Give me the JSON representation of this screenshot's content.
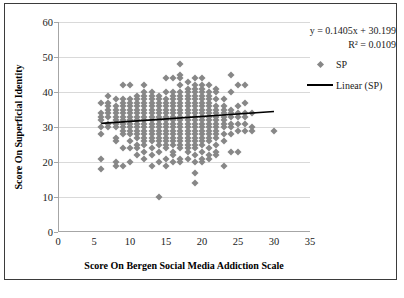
{
  "chart_data": {
    "type": "scatter",
    "title": "",
    "xlabel": "Score On Bergen Social Media Addiction Scale",
    "ylabel": "Score On Superficial Identity",
    "xlim": [
      0,
      35
    ],
    "ylim": [
      0,
      60
    ],
    "xticks": [
      0,
      5,
      10,
      15,
      20,
      25,
      30,
      35
    ],
    "yticks": [
      0,
      10,
      20,
      30,
      40,
      50,
      60
    ],
    "grid": "horizontal",
    "legend_position": "right",
    "marker_color": "#878787",
    "marker_shape": "diamond",
    "trendline_color": "#000000",
    "annotations": {
      "equation": "y = 0.1405x + 30.199",
      "r_squared": "R² = 0.0109"
    },
    "legend": [
      {
        "label": "SP",
        "key": "diamond"
      },
      {
        "label": "Linear (SP)",
        "key": "line"
      }
    ],
    "trendline": {
      "slope": 0.1405,
      "intercept": 30.199,
      "r2": 0.0109,
      "x_start": 6,
      "x_end": 30,
      "y_start": 31.04,
      "y_end": 34.41
    },
    "series": [
      {
        "name": "SP",
        "points": [
          [
            6,
            18
          ],
          [
            6,
            21
          ],
          [
            6,
            28
          ],
          [
            6,
            33
          ],
          [
            6,
            34
          ],
          [
            6,
            37
          ],
          [
            6,
            30
          ],
          [
            6,
            32
          ],
          [
            7,
            30
          ],
          [
            7,
            33
          ],
          [
            7,
            34
          ],
          [
            7,
            35
          ],
          [
            7,
            36
          ],
          [
            7,
            39
          ],
          [
            7,
            31
          ],
          [
            7,
            37
          ],
          [
            8,
            19
          ],
          [
            8,
            20
          ],
          [
            8,
            26
          ],
          [
            8,
            27
          ],
          [
            8,
            30
          ],
          [
            8,
            32
          ],
          [
            8,
            33
          ],
          [
            8,
            34
          ],
          [
            8,
            35
          ],
          [
            8,
            36
          ],
          [
            8,
            38
          ],
          [
            8,
            31
          ],
          [
            9,
            19
          ],
          [
            9,
            24
          ],
          [
            9,
            29
          ],
          [
            9,
            30
          ],
          [
            9,
            31
          ],
          [
            9,
            32
          ],
          [
            9,
            33
          ],
          [
            9,
            34
          ],
          [
            9,
            35
          ],
          [
            9,
            36
          ],
          [
            9,
            37
          ],
          [
            9,
            38
          ],
          [
            9,
            42
          ],
          [
            9,
            28
          ],
          [
            10,
            20
          ],
          [
            10,
            24
          ],
          [
            10,
            28
          ],
          [
            10,
            29
          ],
          [
            10,
            30
          ],
          [
            10,
            31
          ],
          [
            10,
            32
          ],
          [
            10,
            33
          ],
          [
            10,
            34
          ],
          [
            10,
            35
          ],
          [
            10,
            36
          ],
          [
            10,
            37
          ],
          [
            10,
            38
          ],
          [
            10,
            42
          ],
          [
            10,
            26
          ],
          [
            11,
            22
          ],
          [
            11,
            25
          ],
          [
            11,
            27
          ],
          [
            11,
            28
          ],
          [
            11,
            29
          ],
          [
            11,
            30
          ],
          [
            11,
            31
          ],
          [
            11,
            32
          ],
          [
            11,
            33
          ],
          [
            11,
            34
          ],
          [
            11,
            35
          ],
          [
            11,
            36
          ],
          [
            11,
            37
          ],
          [
            11,
            38
          ],
          [
            11,
            39
          ],
          [
            11,
            24
          ],
          [
            12,
            21
          ],
          [
            12,
            23
          ],
          [
            12,
            25
          ],
          [
            12,
            26
          ],
          [
            12,
            27
          ],
          [
            12,
            28
          ],
          [
            12,
            29
          ],
          [
            12,
            30
          ],
          [
            12,
            31
          ],
          [
            12,
            32
          ],
          [
            12,
            33
          ],
          [
            12,
            34
          ],
          [
            12,
            35
          ],
          [
            12,
            36
          ],
          [
            12,
            37
          ],
          [
            12,
            38
          ],
          [
            12,
            39
          ],
          [
            12,
            40
          ],
          [
            12,
            42
          ],
          [
            13,
            19
          ],
          [
            13,
            22
          ],
          [
            13,
            24
          ],
          [
            13,
            26
          ],
          [
            13,
            27
          ],
          [
            13,
            28
          ],
          [
            13,
            29
          ],
          [
            13,
            30
          ],
          [
            13,
            31
          ],
          [
            13,
            32
          ],
          [
            13,
            33
          ],
          [
            13,
            34
          ],
          [
            13,
            35
          ],
          [
            13,
            36
          ],
          [
            13,
            37
          ],
          [
            13,
            38
          ],
          [
            13,
            39
          ],
          [
            13,
            40
          ],
          [
            14,
            10
          ],
          [
            14,
            20
          ],
          [
            14,
            23
          ],
          [
            14,
            25
          ],
          [
            14,
            26
          ],
          [
            14,
            27
          ],
          [
            14,
            28
          ],
          [
            14,
            29
          ],
          [
            14,
            30
          ],
          [
            14,
            31
          ],
          [
            14,
            32
          ],
          [
            14,
            33
          ],
          [
            14,
            34
          ],
          [
            14,
            35
          ],
          [
            14,
            36
          ],
          [
            14,
            37
          ],
          [
            14,
            38
          ],
          [
            14,
            39
          ],
          [
            15,
            19
          ],
          [
            15,
            21
          ],
          [
            15,
            24
          ],
          [
            15,
            25
          ],
          [
            15,
            26
          ],
          [
            15,
            27
          ],
          [
            15,
            28
          ],
          [
            15,
            29
          ],
          [
            15,
            30
          ],
          [
            15,
            31
          ],
          [
            15,
            32
          ],
          [
            15,
            33
          ],
          [
            15,
            34
          ],
          [
            15,
            35
          ],
          [
            15,
            36
          ],
          [
            15,
            37
          ],
          [
            15,
            38
          ],
          [
            15,
            40
          ],
          [
            15,
            44
          ],
          [
            16,
            20
          ],
          [
            16,
            22
          ],
          [
            16,
            23
          ],
          [
            16,
            25
          ],
          [
            16,
            26
          ],
          [
            16,
            27
          ],
          [
            16,
            28
          ],
          [
            16,
            29
          ],
          [
            16,
            30
          ],
          [
            16,
            31
          ],
          [
            16,
            32
          ],
          [
            16,
            33
          ],
          [
            16,
            34
          ],
          [
            16,
            35
          ],
          [
            16,
            36
          ],
          [
            16,
            37
          ],
          [
            16,
            38
          ],
          [
            16,
            39
          ],
          [
            16,
            40
          ],
          [
            16,
            44
          ],
          [
            17,
            20
          ],
          [
            17,
            21
          ],
          [
            17,
            24
          ],
          [
            17,
            25
          ],
          [
            17,
            26
          ],
          [
            17,
            27
          ],
          [
            17,
            28
          ],
          [
            17,
            29
          ],
          [
            17,
            30
          ],
          [
            17,
            31
          ],
          [
            17,
            32
          ],
          [
            17,
            33
          ],
          [
            17,
            34
          ],
          [
            17,
            35
          ],
          [
            17,
            36
          ],
          [
            17,
            37
          ],
          [
            17,
            38
          ],
          [
            17,
            39
          ],
          [
            17,
            40
          ],
          [
            17,
            42
          ],
          [
            17,
            44
          ],
          [
            17,
            45
          ],
          [
            17,
            48
          ],
          [
            18,
            21
          ],
          [
            18,
            23
          ],
          [
            18,
            24
          ],
          [
            18,
            25
          ],
          [
            18,
            26
          ],
          [
            18,
            27
          ],
          [
            18,
            28
          ],
          [
            18,
            29
          ],
          [
            18,
            30
          ],
          [
            18,
            31
          ],
          [
            18,
            32
          ],
          [
            18,
            33
          ],
          [
            18,
            34
          ],
          [
            18,
            35
          ],
          [
            18,
            36
          ],
          [
            18,
            37
          ],
          [
            18,
            38
          ],
          [
            18,
            39
          ],
          [
            18,
            40
          ],
          [
            18,
            41
          ],
          [
            18,
            43
          ],
          [
            19,
            14
          ],
          [
            19,
            17
          ],
          [
            19,
            20
          ],
          [
            19,
            22
          ],
          [
            19,
            24
          ],
          [
            19,
            25
          ],
          [
            19,
            26
          ],
          [
            19,
            27
          ],
          [
            19,
            28
          ],
          [
            19,
            29
          ],
          [
            19,
            30
          ],
          [
            19,
            31
          ],
          [
            19,
            32
          ],
          [
            19,
            33
          ],
          [
            19,
            34
          ],
          [
            19,
            35
          ],
          [
            19,
            36
          ],
          [
            19,
            37
          ],
          [
            19,
            38
          ],
          [
            19,
            39
          ],
          [
            19,
            40
          ],
          [
            19,
            41
          ],
          [
            19,
            42
          ],
          [
            19,
            44
          ],
          [
            20,
            20
          ],
          [
            20,
            21
          ],
          [
            20,
            23
          ],
          [
            20,
            25
          ],
          [
            20,
            26
          ],
          [
            20,
            27
          ],
          [
            20,
            28
          ],
          [
            20,
            29
          ],
          [
            20,
            30
          ],
          [
            20,
            31
          ],
          [
            20,
            32
          ],
          [
            20,
            33
          ],
          [
            20,
            34
          ],
          [
            20,
            35
          ],
          [
            20,
            36
          ],
          [
            20,
            37
          ],
          [
            20,
            38
          ],
          [
            20,
            39
          ],
          [
            20,
            40
          ],
          [
            20,
            41
          ],
          [
            20,
            42
          ],
          [
            20,
            44
          ],
          [
            21,
            21
          ],
          [
            21,
            22
          ],
          [
            21,
            24
          ],
          [
            21,
            26
          ],
          [
            21,
            27
          ],
          [
            21,
            28
          ],
          [
            21,
            29
          ],
          [
            21,
            30
          ],
          [
            21,
            31
          ],
          [
            21,
            32
          ],
          [
            21,
            33
          ],
          [
            21,
            34
          ],
          [
            21,
            35
          ],
          [
            21,
            36
          ],
          [
            21,
            37
          ],
          [
            21,
            38
          ],
          [
            21,
            39
          ],
          [
            21,
            40
          ],
          [
            21,
            42
          ],
          [
            22,
            22
          ],
          [
            22,
            23
          ],
          [
            22,
            25
          ],
          [
            22,
            27
          ],
          [
            22,
            28
          ],
          [
            22,
            29
          ],
          [
            22,
            30
          ],
          [
            22,
            31
          ],
          [
            22,
            32
          ],
          [
            22,
            33
          ],
          [
            22,
            34
          ],
          [
            22,
            35
          ],
          [
            22,
            36
          ],
          [
            22,
            38
          ],
          [
            22,
            40
          ],
          [
            22,
            41
          ],
          [
            23,
            19
          ],
          [
            23,
            26
          ],
          [
            23,
            28
          ],
          [
            23,
            30
          ],
          [
            23,
            31
          ],
          [
            23,
            32
          ],
          [
            23,
            33
          ],
          [
            23,
            34
          ],
          [
            23,
            35
          ],
          [
            23,
            36
          ],
          [
            23,
            38
          ],
          [
            24,
            23
          ],
          [
            24,
            28
          ],
          [
            24,
            30
          ],
          [
            24,
            31
          ],
          [
            24,
            33
          ],
          [
            24,
            34
          ],
          [
            24,
            35
          ],
          [
            24,
            40
          ],
          [
            24,
            45
          ],
          [
            25,
            23
          ],
          [
            25,
            29
          ],
          [
            25,
            31
          ],
          [
            25,
            33
          ],
          [
            25,
            34
          ],
          [
            25,
            36
          ],
          [
            25,
            42
          ],
          [
            26,
            29
          ],
          [
            26,
            31
          ],
          [
            26,
            33
          ],
          [
            26,
            34
          ],
          [
            26,
            37
          ],
          [
            26,
            42
          ],
          [
            27,
            29
          ],
          [
            27,
            30
          ],
          [
            27,
            34
          ],
          [
            30,
            29
          ]
        ]
      }
    ]
  }
}
